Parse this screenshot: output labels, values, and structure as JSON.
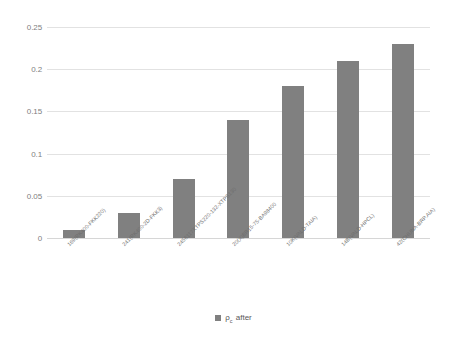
{
  "chart_data": {
    "type": "bar",
    "title": "",
    "subtitle": "",
    "xlabel": "",
    "ylabel": "",
    "ylim": [
      0,
      0.25
    ],
    "yticks": [
      "0",
      "0.05",
      "0.1",
      "0.15",
      "0.2",
      "0.25"
    ],
    "ytick_values": [
      0,
      0.05,
      0.1,
      0.15,
      0.2,
      0.25
    ],
    "grid": true,
    "legend_position": "bottom-center",
    "bar_color": "#808080",
    "gridline_color": "#e2e2e2",
    "background_color": "#ffffff",
    "categories": [
      "169(RK400-FKK220)",
      "241(RK400-2D-FKK3)",
      "2456117XTPS220-132-XTPS130",
      "20(X)BR15-75-BA98400",
      "10K(VALD-TAIA)",
      "14B(VALD-HPCL)",
      "42(CHUNA-BRP.AIA)"
    ],
    "values": [
      0.01,
      0.03,
      0.07,
      0.14,
      0.18,
      0.21,
      0.23
    ],
    "series": [
      {
        "name": "ρ c after",
        "values": [
          0.01,
          0.03,
          0.07,
          0.14,
          0.18,
          0.21,
          0.23
        ]
      }
    ]
  },
  "legend": {
    "symbol": "ρ",
    "subscript": "c",
    "suffix": "after",
    "swatch_color": "#808080"
  }
}
